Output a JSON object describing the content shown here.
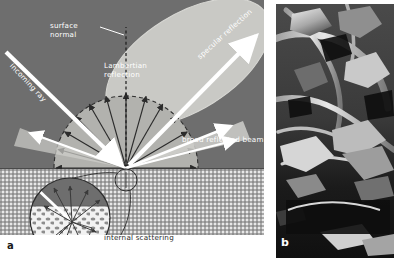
{
  "figure": {
    "panels": [
      {
        "letter": "a",
        "kind": "diagram",
        "caption_letter": "a"
      },
      {
        "letter": "b",
        "kind": "sem-micrograph",
        "caption_letter": "b"
      }
    ]
  },
  "panel_a": {
    "letter": "a",
    "labels": {
      "surface_normal": "surface\nnormal",
      "surface_normal_line1": "surface",
      "surface_normal_line2": "normal",
      "lambertian_line1": "Lambertian",
      "lambertian_line2": "reflection",
      "incoming_ray": "incoming ray",
      "specular_reflection": "specular reflection",
      "broad_reflected_beam": "broad reflected beam",
      "internal_scattering": "internal scattering"
    },
    "regions": {
      "air": "air-above-surface",
      "substrate": "scattering-substrate",
      "surface": "surface-interface"
    },
    "colors": {
      "background_air": "#6e6e6e",
      "substrate": "#e8e8e8",
      "specular_lobe": "#c8c8c4",
      "lambertian_lobe": "#b4b4b0",
      "ray_white": "#ffffff",
      "arrow_dark": "#2b2b2b",
      "surface_line": "#4a4a4a"
    },
    "geometry": {
      "origin_x": 126,
      "origin_y": 168,
      "lambertian_ray_count": 13,
      "lambertian_radius": 72,
      "specular_angle_deg": 45,
      "incidence_angle_deg": 45
    }
  },
  "panel_b": {
    "letter": "b",
    "description": "electron micrograph of fibrous surface",
    "colors": {
      "background": "#141414",
      "fiber_highlight": "#e6e6e6"
    }
  },
  "inset": {
    "name": "internal-scattering-inset",
    "label": "internal scattering",
    "center_x": 70,
    "center_y": 218,
    "radius": 40,
    "callout_circle": {
      "x": 126,
      "y": 180,
      "r": 11
    }
  }
}
